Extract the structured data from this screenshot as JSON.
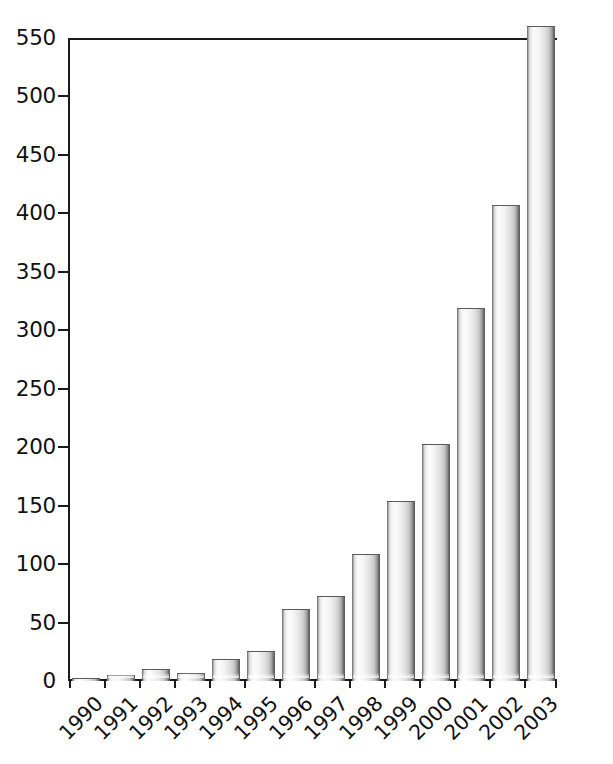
{
  "chart_data": {
    "type": "bar",
    "title": "",
    "subtitle": "",
    "xlabel": "",
    "ylabel": "",
    "categories": [
      "1990",
      "1991",
      "1992",
      "1993",
      "1994",
      "1995",
      "1996",
      "1997",
      "1998",
      "1999",
      "2000",
      "2001",
      "2002",
      "2003"
    ],
    "values": [
      3,
      5,
      10,
      7,
      19,
      26,
      62,
      73,
      109,
      154,
      203,
      319,
      407,
      560
    ],
    "value_notes": {
      "2003": "bar is clipped by the top of the plot frame at 550; actual value exceeds the axis maximum"
    },
    "ylim": [
      0,
      550
    ],
    "ytick_values": [
      0,
      50,
      100,
      150,
      200,
      250,
      300,
      350,
      400,
      450,
      500,
      550
    ],
    "ytick_labels": [
      "0",
      "50",
      "100",
      "150",
      "200",
      "250",
      "300",
      "350",
      "400",
      "450",
      "500",
      "550"
    ],
    "grid": false,
    "legend": null,
    "legend_position": "none",
    "xtick_rotation": -45,
    "bar_style": "cylinder-gradient",
    "colors": {
      "bar_light": "#fbfbfb",
      "bar_mid": "#e0e0e0",
      "bar_edge": "#5f5f5f",
      "axis": "#1a1a1a",
      "text": "#111111",
      "background": "#ffffff"
    }
  }
}
